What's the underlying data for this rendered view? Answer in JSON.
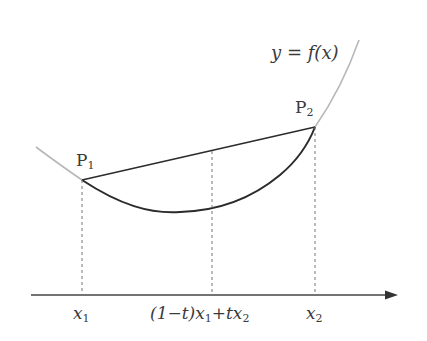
{
  "diagram": {
    "curve_label": "y = f(x)",
    "points": [
      {
        "name": "P",
        "sub": "1"
      },
      {
        "name": "P",
        "sub": "2"
      }
    ],
    "axis_labels": [
      {
        "main": "x",
        "sub": "1"
      },
      {
        "main": "(1−t)x",
        "sub": "1",
        "tail": "+tx",
        "tail_sub": "2"
      },
      {
        "main": "x",
        "sub": "2"
      }
    ],
    "colors": {
      "axis": "#3a3a3a",
      "curve_light": "#b8b8b8",
      "curve_dark": "#2b2b2b",
      "chord": "#2b2b2b",
      "dashed": "#777777"
    }
  }
}
